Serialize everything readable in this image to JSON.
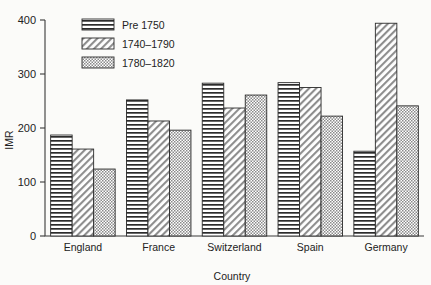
{
  "chart_data": {
    "type": "bar",
    "title": "",
    "xlabel": "Country",
    "ylabel": "IMR",
    "categories": [
      "England",
      "France",
      "Switzerland",
      "Spain",
      "Germany"
    ],
    "series": [
      {
        "name": "Pre 1750",
        "pattern": "horizontal-lines",
        "values": [
          187,
          252,
          283,
          284,
          157
        ]
      },
      {
        "name": "1740–1790",
        "pattern": "diagonal-hatch",
        "values": [
          161,
          213,
          237,
          275,
          394
        ]
      },
      {
        "name": "1780–1820",
        "pattern": "dotted-fill",
        "values": [
          124,
          196,
          261,
          222,
          241
        ]
      }
    ],
    "ylim": [
      0,
      400
    ],
    "yticks": [
      0,
      100,
      200,
      300,
      400
    ],
    "ytick_labels": [
      "0",
      "100",
      "200",
      "300",
      "400"
    ],
    "grid": false,
    "legend_position": "top-left-inside",
    "axis_style": "left-and-bottom-spines-only"
  },
  "legend": {
    "entries": [
      "Pre 1750",
      "1740–1790",
      "1780–1820"
    ]
  },
  "colors": {
    "background": "#fbfbf9",
    "axis": "#3a3a3a",
    "bar_outline": "#2b2b2b",
    "pattern_ink": "#2b2b2b",
    "bar_fill": "#ffffff",
    "text": "#222222"
  }
}
